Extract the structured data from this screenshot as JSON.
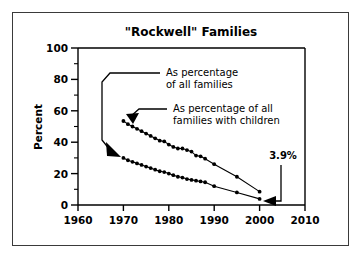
{
  "figure": {
    "title": "\"Rockwell\" Families",
    "background_color": "#ffffff",
    "border_color": "#3a3a3a",
    "ink_color": "#000000"
  },
  "chart_data": {
    "type": "line",
    "title": "\"Rockwell\" Families",
    "xlabel": "",
    "ylabel": "Percent",
    "xlim": [
      1960,
      2010
    ],
    "ylim": [
      0,
      100
    ],
    "xticks": [
      1960,
      1970,
      1980,
      1990,
      2000,
      2010
    ],
    "xticklabels": [
      "1960",
      "1970",
      "1980",
      "1990",
      "2000",
      "2010"
    ],
    "yticks": [
      0,
      20,
      40,
      60,
      80,
      100
    ],
    "yticklabels": [
      "0",
      "20",
      "40",
      "60",
      "80",
      "100"
    ],
    "grid": false,
    "legend": "none",
    "marker": "filled-circle",
    "series": [
      {
        "name": "As percentage of all families with children",
        "x": [
          1970,
          1971,
          1972,
          1973,
          1974,
          1975,
          1976,
          1977,
          1978,
          1979,
          1980,
          1981,
          1982,
          1983,
          1984,
          1985,
          1986,
          1987,
          1988,
          1990,
          1995,
          2000
        ],
        "values": [
          53.5,
          51.5,
          50.0,
          48.5,
          47.0,
          45.5,
          44.0,
          42.5,
          41.0,
          40.5,
          38.5,
          37.0,
          36.0,
          36.0,
          35.0,
          34.0,
          31.5,
          31.0,
          29.5,
          26.0,
          18.0,
          8.5
        ]
      },
      {
        "name": "As percentage of all families",
        "x": [
          1970,
          1971,
          1972,
          1973,
          1974,
          1975,
          1976,
          1977,
          1978,
          1979,
          1980,
          1981,
          1982,
          1983,
          1984,
          1985,
          1986,
          1987,
          1988,
          1990,
          1995,
          2000
        ],
        "values": [
          30.0,
          28.5,
          27.5,
          26.5,
          25.5,
          24.5,
          23.5,
          22.5,
          21.5,
          21.0,
          20.0,
          19.0,
          18.0,
          17.5,
          16.5,
          16.0,
          15.5,
          15.0,
          14.5,
          12.0,
          8.0,
          3.9
        ]
      }
    ],
    "annotations": [
      {
        "id": "annotation-all-families",
        "text_line_1": "As percentage",
        "text_line_2": "of all families",
        "points_to_series": "As percentage of all families",
        "points_to_x": 1970,
        "points_to_y": 30.0
      },
      {
        "id": "annotation-families-with-children",
        "text_line_1": "As percentage of all",
        "text_line_2": "families with children",
        "points_to_series": "As percentage of all families with children",
        "points_to_x": 1970,
        "points_to_y": 53.5
      },
      {
        "id": "annotation-final-value",
        "text": "3.9%",
        "points_to_series": "As percentage of all families",
        "points_to_x": 2000,
        "points_to_y": 3.9
      }
    ]
  }
}
